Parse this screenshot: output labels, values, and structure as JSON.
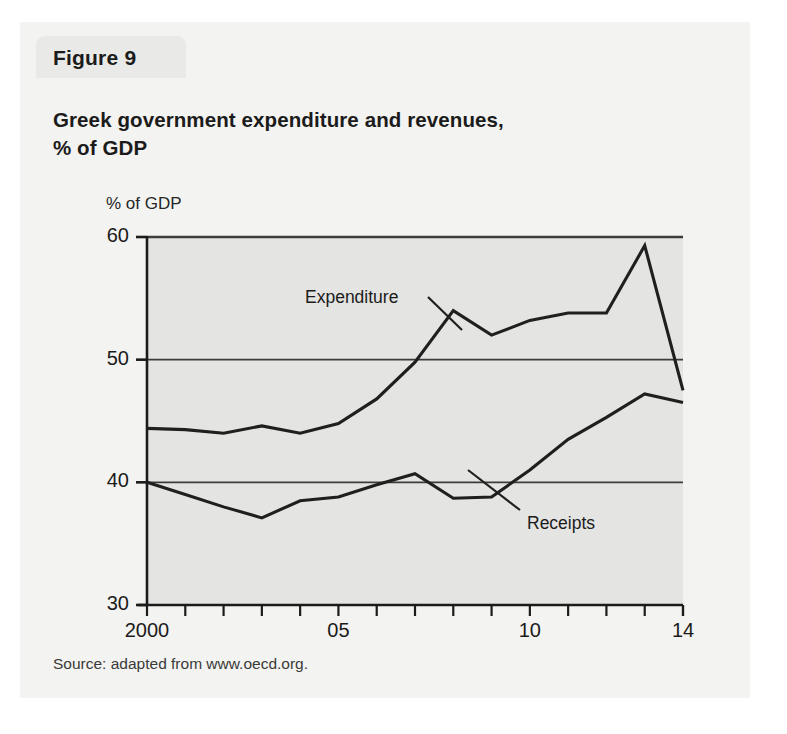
{
  "figure": {
    "tab_label": "Figure 9",
    "title_line1": "Greek government expenditure and revenues,",
    "title_line2": "% of GDP",
    "source": "Source: adapted from www.oecd.org."
  },
  "colors": {
    "page_background": "#ffffff",
    "card_background": "#f3f3f1",
    "tab_background": "#e9e9e7",
    "plot_background": "#e4e4e2",
    "axis": "#1b1b1b",
    "gridline": "#3c3c3c",
    "series_line": "#1f1f1f",
    "text": "#1b1b1b"
  },
  "chart_data": {
    "type": "line",
    "title": "Greek government expenditure and revenues, % of GDP",
    "subtitle": "",
    "xlabel": "",
    "ylabel": "% of GDP",
    "ylabel_position": "above-axis",
    "grid": true,
    "gridlines_y": [
      40,
      50,
      60
    ],
    "legend": "inline-annotations",
    "xlim": [
      2000,
      2014
    ],
    "ylim": [
      30,
      60
    ],
    "y_ticks": [
      30,
      40,
      50,
      60
    ],
    "y_tick_labels": [
      "30",
      "40",
      "50",
      "60"
    ],
    "x": [
      2000,
      2001,
      2002,
      2003,
      2004,
      2005,
      2006,
      2007,
      2008,
      2009,
      2010,
      2011,
      2012,
      2013,
      2014
    ],
    "x_tick_labels": [
      "2000",
      "",
      "",
      "",
      "",
      "05",
      "",
      "",
      "",
      "",
      "10",
      "",
      "",
      "",
      "14"
    ],
    "x_labeled_ticks": [
      {
        "value": 2000,
        "label": "2000"
      },
      {
        "value": 2005,
        "label": "05"
      },
      {
        "value": 2010,
        "label": "10"
      },
      {
        "value": 2014,
        "label": "14"
      }
    ],
    "series": [
      {
        "name": "Expenditure",
        "label": "Expenditure",
        "values": [
          44.4,
          44.3,
          44.0,
          44.6,
          44.0,
          44.8,
          46.8,
          49.8,
          54.0,
          52.0,
          53.2,
          53.8,
          53.8,
          59.3,
          47.5
        ]
      },
      {
        "name": "Receipts",
        "label": "Receipts",
        "values": [
          40.0,
          39.0,
          38.0,
          37.1,
          38.5,
          38.8,
          39.8,
          40.7,
          38.7,
          38.8,
          41.0,
          43.5,
          45.3,
          47.2,
          46.5
        ]
      }
    ],
    "annotations": [
      {
        "text": "Expenditure",
        "target_x": 2006,
        "target_y": 46.8
      },
      {
        "text": "Receipts",
        "target_x": 2009,
        "target_y": 38.7
      }
    ]
  }
}
